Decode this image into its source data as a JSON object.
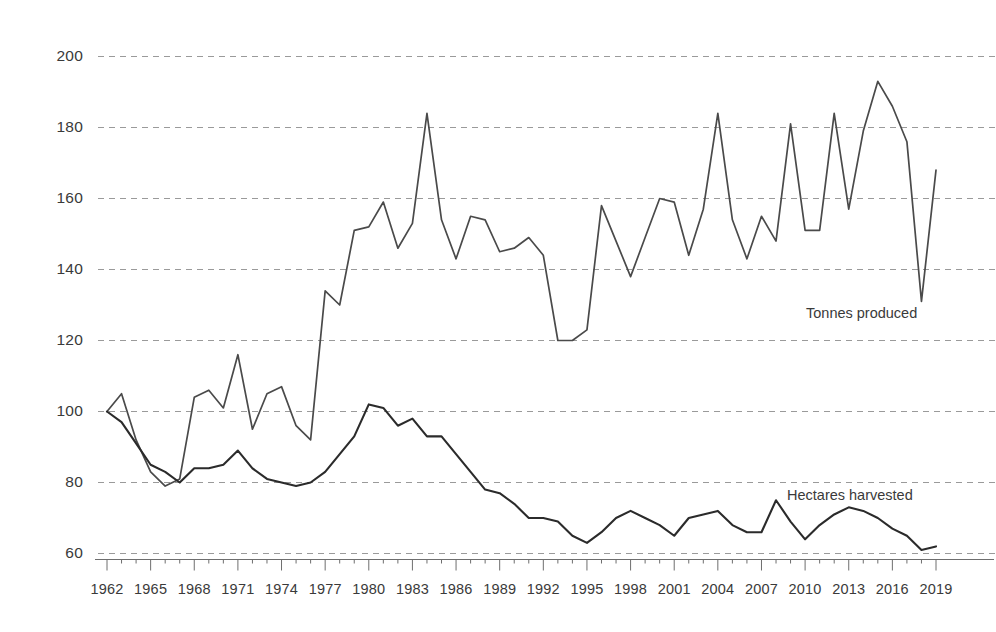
{
  "chart_data": {
    "type": "line",
    "title": "",
    "subtitle": "",
    "xlabel": "",
    "ylabel": "",
    "xlim": [
      1962,
      2019
    ],
    "ylim": [
      55,
      203
    ],
    "yticks": [
      60,
      80,
      100,
      120,
      140,
      160,
      180,
      200
    ],
    "xticks": [
      1962,
      1965,
      1968,
      1971,
      1974,
      1977,
      1980,
      1983,
      1986,
      1989,
      1992,
      1995,
      1998,
      2001,
      2004,
      2007,
      2010,
      2013,
      2016,
      2019
    ],
    "grid": "horizontal-dashed",
    "legend": "inline-annotations",
    "x": [
      1962,
      1963,
      1964,
      1965,
      1966,
      1967,
      1968,
      1969,
      1970,
      1971,
      1972,
      1973,
      1974,
      1975,
      1976,
      1977,
      1978,
      1979,
      1980,
      1981,
      1982,
      1983,
      1984,
      1985,
      1986,
      1987,
      1988,
      1989,
      1990,
      1991,
      1992,
      1993,
      1994,
      1995,
      1996,
      1997,
      1998,
      1999,
      2000,
      2001,
      2002,
      2003,
      2004,
      2005,
      2006,
      2007,
      2008,
      2009,
      2010,
      2011,
      2012,
      2013,
      2014,
      2015,
      2016,
      2017,
      2018,
      2019
    ],
    "series": [
      {
        "name": "Tonnes produced",
        "color": "#4a4a4a",
        "annotation": "Tonnes produced",
        "values": [
          100,
          105,
          92,
          83,
          79,
          81,
          104,
          106,
          101,
          116,
          95,
          105,
          107,
          96,
          92,
          134,
          130,
          151,
          152,
          159,
          146,
          153,
          184,
          154,
          143,
          155,
          154,
          145,
          146,
          149,
          144,
          120,
          120,
          123,
          158,
          148,
          138,
          149,
          160,
          159,
          144,
          157,
          184,
          154,
          143,
          155,
          148,
          181,
          151,
          151,
          184,
          157,
          179,
          193,
          186,
          176,
          131,
          168
        ]
      },
      {
        "name": "Hectares harvested",
        "color": "#2b2b2b",
        "annotation": "Hectares harvested",
        "values": [
          100,
          97,
          91,
          85,
          83,
          80,
          84,
          84,
          85,
          89,
          84,
          81,
          80,
          79,
          80,
          83,
          88,
          93,
          102,
          101,
          96,
          98,
          93,
          93,
          88,
          83,
          78,
          77,
          74,
          70,
          70,
          69,
          65,
          63,
          66,
          70,
          72,
          70,
          68,
          65,
          70,
          71,
          72,
          68,
          66,
          66,
          75,
          69,
          64,
          68,
          71,
          73,
          72,
          70,
          67,
          65,
          61,
          62
        ]
      }
    ]
  },
  "axes": {
    "ytick_labels": [
      "200",
      "180",
      "160",
      "140",
      "120",
      "100",
      "80",
      "60"
    ],
    "xtick_labels": [
      "1962",
      "1965",
      "1968",
      "1971",
      "1974",
      "1977",
      "1980",
      "1983",
      "1986",
      "1989",
      "1992",
      "1995",
      "1998",
      "2001",
      "2004",
      "2007",
      "2010",
      "2013",
      "2016",
      "2019"
    ]
  },
  "annotations": {
    "tonnes_label": "Tonnes produced",
    "hectares_label": "Hectares harvested"
  },
  "colors": {
    "tonnes": "#4a4a4a",
    "hectares": "#2b2b2b",
    "grid": "#9a9a9a",
    "axis": "#6e6e6e",
    "text": "#3a3a3a",
    "background": "#ffffff"
  }
}
